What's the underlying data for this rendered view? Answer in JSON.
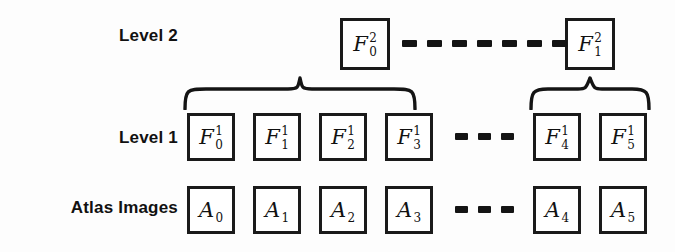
{
  "figure": {
    "background_color": "#fdfdfd",
    "ink_color": "#141414",
    "box_border_color": "#1a1a1a",
    "box_fill_color": "#ffffff"
  },
  "rows": [
    {
      "id": "level2",
      "label": "Level 2"
    },
    {
      "id": "level1",
      "label": "Level 1"
    },
    {
      "id": "atlas",
      "label": "Atlas Images"
    }
  ],
  "level2_nodes": [
    {
      "base": "F",
      "sup": "2",
      "sub": "0",
      "text": "F_0^2"
    },
    {
      "base": "F",
      "sup": "2",
      "sub": "1",
      "text": "F_1^2"
    }
  ],
  "level1_nodes": [
    {
      "base": "F",
      "sup": "1",
      "sub": "0",
      "text": "F_0^1"
    },
    {
      "base": "F",
      "sup": "1",
      "sub": "1",
      "text": "F_1^1"
    },
    {
      "base": "F",
      "sup": "1",
      "sub": "2",
      "text": "F_2^1"
    },
    {
      "base": "F",
      "sup": "1",
      "sub": "3",
      "text": "F_3^1"
    },
    {
      "base": "F",
      "sup": "1",
      "sub": "4",
      "text": "F_4^1"
    },
    {
      "base": "F",
      "sup": "1",
      "sub": "5",
      "text": "F_5^1"
    }
  ],
  "atlas_nodes": [
    {
      "base": "A",
      "sup": "",
      "sub": "0",
      "text": "A_0"
    },
    {
      "base": "A",
      "sup": "",
      "sub": "1",
      "text": "A_1"
    },
    {
      "base": "A",
      "sup": "",
      "sub": "2",
      "text": "A_2"
    },
    {
      "base": "A",
      "sup": "",
      "sub": "3",
      "text": "A_3"
    },
    {
      "base": "A",
      "sup": "",
      "sub": "4",
      "text": "A_4"
    },
    {
      "base": "A",
      "sup": "",
      "sub": "5",
      "text": "A_5"
    }
  ],
  "ellipses": [
    {
      "id": "level2-gap",
      "dash_count": 7,
      "style": "dashed-line"
    },
    {
      "id": "level1-gap",
      "dash_count": 3,
      "style": "dashed-line"
    },
    {
      "id": "atlas-gap",
      "dash_count": 3,
      "style": "dashed-line"
    }
  ],
  "braces": [
    {
      "id": "brace-left",
      "spans": [
        "F_0^1",
        "F_1^1",
        "F_2^1",
        "F_3^1"
      ],
      "points_to": "F_0^2"
    },
    {
      "id": "brace-right",
      "spans": [
        "F_4^1",
        "F_5^1"
      ],
      "points_to": "F_1^2"
    }
  ]
}
